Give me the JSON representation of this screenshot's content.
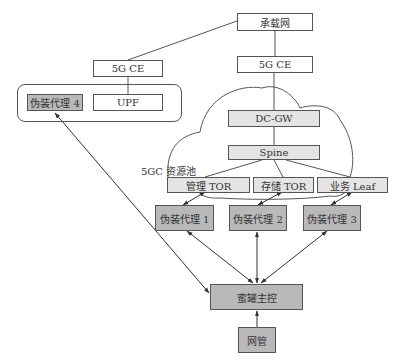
{
  "diagram": {
    "nodes": {
      "carrier_network": "承载网",
      "ce_right": "5G CE",
      "ce_left": "5G CE",
      "upf": "UPF",
      "decoy_agent_4": "伪装代理 4",
      "dc_gw": "DC-GW",
      "spine": "Spine",
      "mgmt_tor": "管理 TOR",
      "storage_tor": "存储 TOR",
      "service_leaf": "业务 Leaf",
      "decoy_agent_1": "伪装代理 1",
      "decoy_agent_2": "伪装代理 2",
      "decoy_agent_3": "伪装代理 3",
      "honeypot_master": "蜜罐主控",
      "network_mgmt": "网管"
    },
    "labels": {
      "resource_pool": "5GC 资源池"
    },
    "edges": [
      {
        "from": "carrier_network",
        "to": "ce_left",
        "type": "line"
      },
      {
        "from": "carrier_network",
        "to": "ce_right",
        "type": "line"
      },
      {
        "from": "ce_left",
        "to": "upf",
        "type": "line"
      },
      {
        "from": "ce_right",
        "to": "dc_gw",
        "type": "line"
      },
      {
        "from": "dc_gw",
        "to": "spine",
        "type": "line"
      },
      {
        "from": "spine",
        "to": "mgmt_tor",
        "type": "line"
      },
      {
        "from": "spine",
        "to": "storage_tor",
        "type": "line"
      },
      {
        "from": "spine",
        "to": "service_leaf",
        "type": "line"
      },
      {
        "from": "mgmt_tor",
        "to": "decoy_agent_1",
        "type": "bidirectional-arrow"
      },
      {
        "from": "storage_tor",
        "to": "decoy_agent_2",
        "type": "bidirectional-arrow"
      },
      {
        "from": "service_leaf",
        "to": "decoy_agent_3",
        "type": "bidirectional-arrow"
      },
      {
        "from": "decoy_agent_1",
        "to": "honeypot_master",
        "type": "bidirectional-arrow"
      },
      {
        "from": "decoy_agent_2",
        "to": "honeypot_master",
        "type": "bidirectional-arrow"
      },
      {
        "from": "decoy_agent_3",
        "to": "honeypot_master",
        "type": "bidirectional-arrow"
      },
      {
        "from": "decoy_agent_4",
        "to": "honeypot_master",
        "type": "bidirectional-arrow"
      },
      {
        "from": "network_mgmt",
        "to": "honeypot_master",
        "type": "arrow"
      }
    ],
    "colors": {
      "stroke": "#555555",
      "white_fill": "#ffffff",
      "light_fill": "#e4e4e4",
      "dark_fill": "#b9b9b9"
    }
  }
}
